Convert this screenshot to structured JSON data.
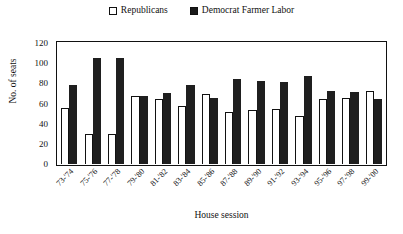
{
  "chart_data": {
    "type": "bar",
    "title": "",
    "subtitle": "",
    "xlabel": "House session",
    "ylabel": "No. of seats",
    "ylim": [
      0,
      120
    ],
    "ytick_step": 20,
    "yticks": [
      120,
      100,
      80,
      60,
      40,
      20,
      0
    ],
    "grid": false,
    "legend_position": "top-center",
    "bar_layout": "grouped",
    "categories": [
      "73-'74",
      "75-'76",
      "77-'78",
      "79-'80",
      "81-'82",
      "83-'84",
      "85-'86",
      "87-'88",
      "89-'90",
      "91-'92",
      "93-'94",
      "95-'96",
      "97-'98",
      "99-'00"
    ],
    "series": [
      {
        "name": "Republicans",
        "swatch": "open",
        "color": "#ffffff",
        "edge_color": "#111111",
        "values": [
          56,
          30,
          30,
          67,
          64,
          58,
          69,
          52,
          54,
          55,
          48,
          64,
          65,
          72
        ]
      },
      {
        "name": "Democrat Farmer Labor",
        "swatch": "filled",
        "color": "#1f1f1f",
        "edge_color": "#1f1f1f",
        "values": [
          78,
          105,
          105,
          67,
          70,
          78,
          65,
          84,
          82,
          81,
          87,
          72,
          71,
          64
        ]
      }
    ]
  },
  "legend": {
    "entries": [
      {
        "label": "Republicans",
        "swatch": "open"
      },
      {
        "label": "Democrat Farmer Labor",
        "swatch": "filled"
      }
    ]
  }
}
